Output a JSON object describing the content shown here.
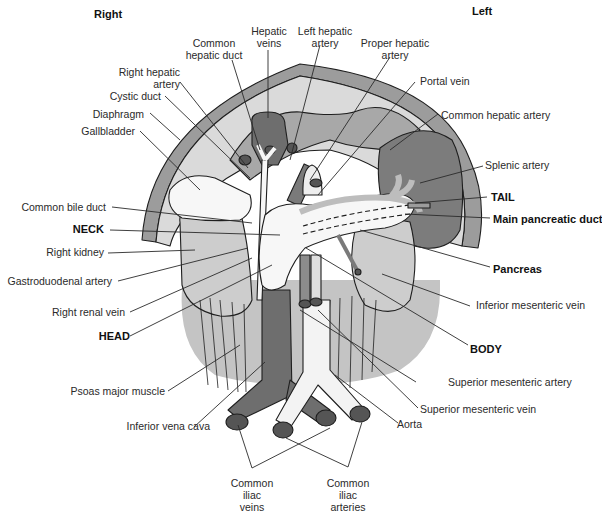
{
  "orientation": {
    "right": "Right",
    "left": "Left"
  },
  "colors": {
    "dark_vessel": "#6e6e6e",
    "mid_gray": "#9a9a9a",
    "light_gray": "#c8c8c8",
    "lighter_gray": "#dcdcdc",
    "organ_white": "#f7f7f7",
    "outline": "#1e1e1e"
  },
  "labels": {
    "common_hepatic_duct": [
      "Common",
      "hepatic duct"
    ],
    "hepatic_veins": [
      "Hepatic",
      "veins"
    ],
    "left_hepatic_artery": [
      "Left hepatic",
      "artery"
    ],
    "proper_hepatic_artery": [
      "Proper hepatic",
      "artery"
    ],
    "right_hepatic_artery": [
      "Right hepatic",
      "artery"
    ],
    "cystic_duct": "Cystic duct",
    "diaphragm": "Diaphragm",
    "gallbladder": "Gallbladder",
    "portal_vein": "Portal vein",
    "common_hepatic_artery": "Common hepatic artery",
    "splenic_artery": "Splenic artery",
    "tail": "TAIL",
    "main_pancreatic_duct": "Main pancreatic duct",
    "common_bile_duct": "Common bile duct",
    "neck": "NECK",
    "right_kidney": "Right kidney",
    "gastroduodenal_artery": "Gastroduodenal artery",
    "pancreas": "Pancreas",
    "inferior_mesenteric_vein": "Inferior mesenteric vein",
    "right_renal_vein": "Right renal vein",
    "head": "HEAD",
    "body": "BODY",
    "psoas_major_muscle": "Psoas major muscle",
    "superior_mesenteric_artery": "Superior mesenteric artery",
    "superior_mesenteric_vein": "Superior mesenteric vein",
    "inferior_vena_cava": "Inferior vena cava",
    "aorta": "Aorta",
    "common_iliac_veins": [
      "Common",
      "iliac",
      "veins"
    ],
    "common_iliac_arteries": [
      "Common",
      "iliac",
      "arteries"
    ]
  }
}
